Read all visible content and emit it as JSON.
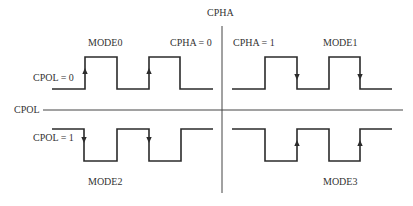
{
  "axes": {
    "vertical_label": "CPHA",
    "horizontal_label": "CPOL"
  },
  "colors": {
    "background": "#ffffff",
    "line": "#2b2b2b",
    "axis": "#444444",
    "text": "#333333"
  },
  "quadrants": [
    {
      "id": "mode0",
      "mode_label": "MODE0",
      "cpol_label": "CPOL = 0",
      "cpha_label": "CPHA = 0",
      "idle_level": "low",
      "arrow_edge": "rising",
      "arrow_direction": "up"
    },
    {
      "id": "mode1",
      "mode_label": "MODE1",
      "cpha_label": "CPHA = 1",
      "idle_level": "low",
      "arrow_edge": "falling",
      "arrow_direction": "down"
    },
    {
      "id": "mode2",
      "mode_label": "MODE2",
      "cpol_label": "CPOL = 1",
      "idle_level": "high",
      "arrow_edge": "falling",
      "arrow_direction": "down"
    },
    {
      "id": "mode3",
      "mode_label": "MODE3",
      "idle_level": "high",
      "arrow_edge": "rising",
      "arrow_direction": "up"
    }
  ]
}
